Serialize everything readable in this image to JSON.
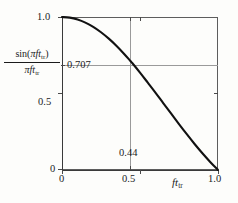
{
  "chart_data": {
    "type": "line",
    "title": "",
    "subtitle": "",
    "xlabel": "ft_tr",
    "ylabel": "sin(pi f t_tr) / (pi f t_tr)",
    "xlim": [
      0,
      1.0
    ],
    "ylim": [
      0,
      1.0
    ],
    "grid": false,
    "legend_position": "none",
    "x_ticks": [
      0,
      0.5,
      1.0
    ],
    "x_tick_labels": [
      "0",
      "0.5",
      "1.0"
    ],
    "y_ticks": [
      0,
      0.5,
      0.707,
      1.0
    ],
    "y_tick_labels": [
      "0",
      "0.5",
      "0.707",
      "1.0"
    ],
    "series": [
      {
        "name": "sinc",
        "x": [
          0.0,
          0.05,
          0.1,
          0.15,
          0.2,
          0.25,
          0.3,
          0.35,
          0.4,
          0.44,
          0.45,
          0.5,
          0.55,
          0.6,
          0.65,
          0.7,
          0.75,
          0.8,
          0.85,
          0.9,
          0.95,
          1.0
        ],
        "values": [
          1.0,
          0.9959,
          0.9836,
          0.9632,
          0.9355,
          0.9003,
          0.8584,
          0.8106,
          0.7568,
          0.7107,
          0.6993,
          0.6366,
          0.5708,
          0.5046,
          0.4359,
          0.3679,
          0.3001,
          0.2339,
          0.1699,
          0.1093,
          0.0528,
          0.0
        ]
      }
    ],
    "annotations": [
      {
        "name": "crossing-marker",
        "x_value": 0.44,
        "y_value": 0.707,
        "x_label": "0.44",
        "y_label": "0.707",
        "style": "reference-lines"
      }
    ],
    "colors": {
      "curve": "#111111",
      "frame": "#5d5d5d",
      "reference_line": "#9a9a9a",
      "background": "#fdfdfb",
      "text": "#1b1b1b"
    }
  },
  "axes": {
    "y_title": {
      "numerator_sin": "sin(",
      "numerator_pi": "π",
      "numerator_f": "f",
      "numerator_t": "t",
      "numerator_sub": "tr",
      "numerator_close": ")",
      "denominator_pi": "π",
      "denominator_f": "f",
      "denominator_t": "t",
      "denominator_sub": "tr"
    },
    "x_title": {
      "f": "f",
      "t": "t",
      "sub": "tr"
    }
  },
  "labels": {
    "y_1_0": "1.0",
    "y_0_707": "0.707",
    "y_0_5": "0.5",
    "y_0": "0",
    "x_0": "0",
    "x_0_5": "0.5",
    "x_1_0": "1.0",
    "annotation_044": "0.44"
  }
}
